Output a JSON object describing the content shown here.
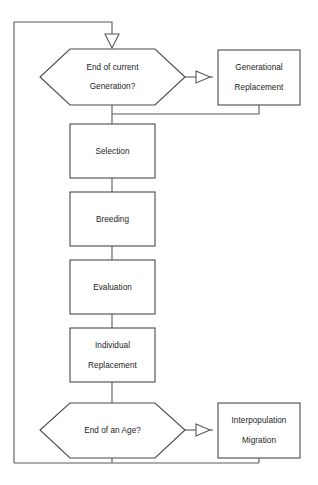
{
  "diagram": {
    "title": "",
    "type": "flowchart",
    "colors": {
      "stroke": "#4a4a4a",
      "connector": "#5a5a5a",
      "fill": "#ffffff",
      "text": "#1c1c1c",
      "background": "#ffffff"
    },
    "nodes": [
      {
        "id": "end-of-current-generation",
        "shape": "hexagon",
        "lines": [
          "End of current",
          "Generation?"
        ],
        "line1": "End of current",
        "line2": "Generation?"
      },
      {
        "id": "generational-replacement",
        "shape": "rectangle",
        "lines": [
          "Generational",
          "Replacement"
        ],
        "line1": "Generational",
        "line2": "Replacement"
      },
      {
        "id": "selection",
        "shape": "rectangle",
        "lines": [
          "Selection"
        ],
        "line1": "Selection",
        "line2": ""
      },
      {
        "id": "breeding",
        "shape": "rectangle",
        "lines": [
          "Breeding"
        ],
        "line1": "Breeding",
        "line2": ""
      },
      {
        "id": "evaluation",
        "shape": "rectangle",
        "lines": [
          "Evaluation"
        ],
        "line1": "Evaluation",
        "line2": ""
      },
      {
        "id": "individual-replacement",
        "shape": "rectangle",
        "lines": [
          "Individual",
          "Replacement"
        ],
        "line1": "Individual",
        "line2": "Replacement"
      },
      {
        "id": "end-of-an-age",
        "shape": "hexagon",
        "lines": [
          "End of an Age?"
        ],
        "line1": "End of an Age?",
        "line2": ""
      },
      {
        "id": "interpopulation-migration",
        "shape": "rectangle",
        "lines": [
          "Interpopulation",
          "Migration"
        ],
        "line1": "Interpopulation",
        "line2": "Migration"
      }
    ],
    "edges": [
      {
        "id": "loop-to-generation-decision",
        "from": "feedback-loop",
        "to": "end-of-current-generation",
        "arrow": "down"
      },
      {
        "id": "generation-decision-to-generational-replacement",
        "from": "end-of-current-generation",
        "to": "generational-replacement",
        "arrow": "right"
      },
      {
        "id": "generational-replacement-return",
        "from": "generational-replacement",
        "to": "main-spine",
        "arrow": "none"
      },
      {
        "id": "generation-decision-to-selection",
        "from": "end-of-current-generation",
        "to": "selection",
        "arrow": "none"
      },
      {
        "id": "selection-to-breeding",
        "from": "selection",
        "to": "breeding",
        "arrow": "none"
      },
      {
        "id": "breeding-to-evaluation",
        "from": "breeding",
        "to": "evaluation",
        "arrow": "none"
      },
      {
        "id": "evaluation-to-individual-replacement",
        "from": "evaluation",
        "to": "individual-replacement",
        "arrow": "none"
      },
      {
        "id": "individual-replacement-to-age-decision",
        "from": "individual-replacement",
        "to": "end-of-an-age",
        "arrow": "none"
      },
      {
        "id": "age-decision-to-interpopulation-migration",
        "from": "end-of-an-age",
        "to": "interpopulation-migration",
        "arrow": "right"
      },
      {
        "id": "bottom-return-to-loop",
        "from": "end-of-an-age",
        "to": "feedback-loop",
        "arrow": "none"
      }
    ]
  }
}
